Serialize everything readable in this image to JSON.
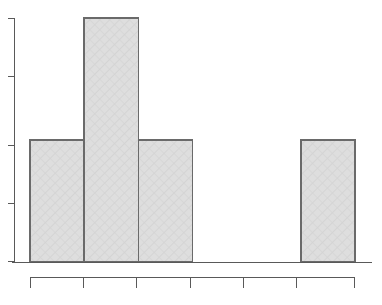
{
  "figure": {
    "name": "histogram-figure",
    "background_color": "#ffffff",
    "width": 382,
    "height": 305
  },
  "style": {
    "bar_fill": "#dcdcdc",
    "bar_hatch": "#cfcfcf",
    "bar_border": "#6a6a6a",
    "axis_color": "#595959",
    "tick_color": "#595959"
  },
  "chart_data": {
    "type": "bar",
    "title": "",
    "subtitle": "",
    "xlabel": "",
    "ylabel": "",
    "categories": [
      "1",
      "2",
      "3",
      "4",
      "5",
      "6"
    ],
    "values": [
      2,
      4,
      2,
      0,
      0,
      2
    ],
    "series": [
      {
        "name": "frequency",
        "values": [
          2,
          4,
          2,
          0,
          0,
          2
        ]
      }
    ],
    "bin_edges": [
      0,
      1,
      2,
      3,
      4,
      5,
      6
    ],
    "x_tick_labels": [
      "",
      "",
      "",
      "",
      "",
      "",
      ""
    ],
    "y_tick_labels": [
      "",
      "",
      "",
      "",
      ""
    ],
    "y_tick_values": [
      0,
      1,
      2,
      3,
      4
    ],
    "xlim": [
      0,
      6
    ],
    "ylim": [
      0,
      4
    ],
    "grid": false,
    "legend": false,
    "legend_position": "none",
    "annotations": []
  },
  "axes": {
    "y_axis": {
      "name": "y-axis",
      "tick_count": 5,
      "orientation": "vertical"
    },
    "x_axis": {
      "name": "x-axis",
      "tick_count": 0,
      "orientation": "horizontal"
    },
    "secondary_x_axis": {
      "name": "secondary-x-axis",
      "tick_count": 7,
      "orientation": "horizontal"
    }
  }
}
